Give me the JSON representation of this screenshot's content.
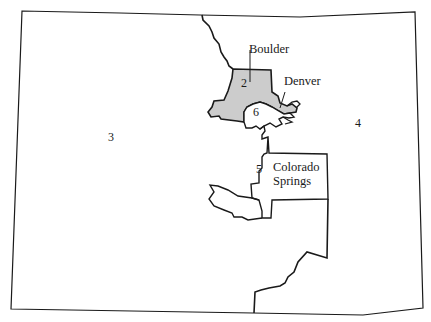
{
  "map": {
    "region": "Colorado",
    "colors": {
      "outline": "#1a1a1a",
      "highlight_fill": "#cccccc",
      "background": "#ffffff"
    },
    "districts": [
      {
        "number": "2",
        "highlighted": true
      },
      {
        "number": "3",
        "highlighted": false
      },
      {
        "number": "4",
        "highlighted": false
      },
      {
        "number": "5",
        "highlighted": false
      },
      {
        "number": "6",
        "highlighted": false
      }
    ],
    "cities": [
      {
        "name": "Boulder"
      },
      {
        "name": "Denver"
      },
      {
        "name": "Colorado",
        "line2": "Springs"
      }
    ]
  }
}
